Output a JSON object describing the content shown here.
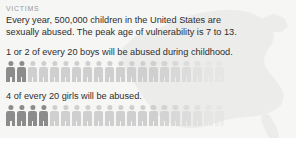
{
  "section": {
    "title": "VICTIMS",
    "lede": "Every year,  500,000 children in the United States are\nsexually abused.  The peak age of vulnerability is 7 to 13."
  },
  "colors": {
    "background": "#f6f6f5",
    "text": "#2e2e2e",
    "section_title": "#9a9a9a",
    "figure_highlight": "#8c8c8c",
    "figure_base": "#cfcfcf",
    "map_fill": "#e4e4e2"
  },
  "chart_data": {
    "type": "bar",
    "title": "VICTIMS",
    "subtitle": "Every year,  500,000 children in the United States are sexually abused.  The peak age of vulnerability is 7 to 13.",
    "xlabel": "",
    "ylabel": "",
    "series": [
      {
        "name": "1 or 2 of every 20 boys will be abused during childhood.",
        "highlighted": 2,
        "total": 20
      },
      {
        "name": "4 of every 20 girls will be abused.",
        "highlighted": 4,
        "total": 20
      }
    ]
  }
}
